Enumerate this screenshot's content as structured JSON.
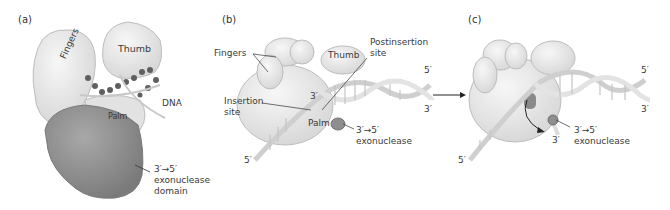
{
  "panels": [
    {
      "id": "a",
      "tag": "(a)",
      "labels": {
        "fingers": "Fingers",
        "thumb": "Thumb",
        "dna": "DNA",
        "palm": "Palm",
        "exo_line1": "3′→5′",
        "exo_line2": "exonuclease",
        "exo_line3": "domain"
      }
    },
    {
      "id": "b",
      "tag": "(b)",
      "labels": {
        "fingers": "Fingers",
        "thumb": "Thumb",
        "postinsertion_line1": "Postinsertion",
        "postinsertion_line2": "site",
        "insertion_line1": "Insertion",
        "insertion_line2": "site",
        "three_prime": "3′",
        "palm": "Palm",
        "exo_line1": "3′→5′",
        "exo_line2": "exonuclease",
        "five_prime_top": "5′",
        "three_prime_right": "3′",
        "five_prime_bottom": "5′"
      }
    },
    {
      "id": "c",
      "tag": "(c)",
      "labels": {
        "five_prime_top": "5′",
        "three_prime_right": "3′",
        "three_prime_bottom": "3′",
        "exo_line1": "3′→5′",
        "exo_line2": "exonuclease",
        "five_prime_bottom": "5′"
      }
    }
  ],
  "colors": {
    "protein_light": "#ececec",
    "protein_outline": "#b8b8b8",
    "exo_domain": "#8f8f8f",
    "dna_backbone": "#d9d9d9",
    "dna_dark": "#5a5a5a",
    "arrow": "#222222"
  }
}
